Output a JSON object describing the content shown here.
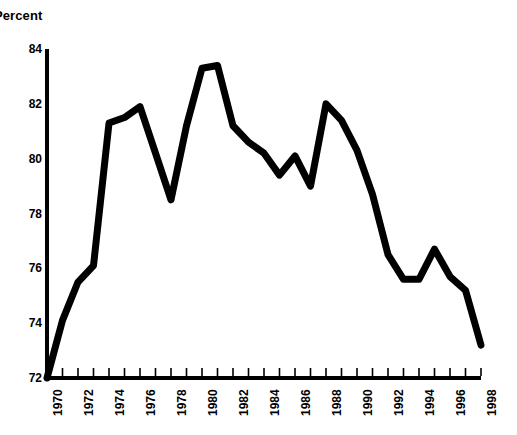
{
  "chart_data": {
    "type": "line",
    "title": "",
    "ylabel": "Percent",
    "xlabel": "",
    "ylim": [
      72,
      84
    ],
    "yticks": [
      72,
      74,
      76,
      78,
      80,
      82,
      84
    ],
    "ytick_labels": [
      "72",
      "74",
      "76",
      "78",
      "80",
      "82",
      "84"
    ],
    "xlim": [
      1970,
      1998
    ],
    "xticks": [
      1970,
      1972,
      1974,
      1976,
      1978,
      1980,
      1982,
      1984,
      1986,
      1988,
      1990,
      1992,
      1994,
      1996,
      1998
    ],
    "xtick_labels": [
      "1970",
      "1972",
      "1974",
      "1976",
      "1978",
      "1980",
      "1982",
      "1984",
      "1986",
      "1988",
      "1990",
      "1992",
      "1994",
      "1996",
      "1998"
    ],
    "minor_xticks_every": 1,
    "grid": false,
    "legend": null,
    "line_color": "#000000",
    "line_width": 7,
    "x": [
      1970,
      1971,
      1972,
      1973,
      1974,
      1975,
      1976,
      1977,
      1978,
      1979,
      1980,
      1981,
      1982,
      1983,
      1984,
      1985,
      1986,
      1987,
      1988,
      1989,
      1990,
      1991,
      1992,
      1993,
      1994,
      1995,
      1996,
      1997,
      1998
    ],
    "values": [
      72.0,
      74.1,
      75.5,
      76.1,
      81.3,
      81.5,
      81.9,
      80.2,
      78.5,
      81.2,
      83.3,
      83.4,
      81.2,
      80.6,
      80.2,
      79.4,
      80.1,
      79.0,
      82.0,
      81.4,
      80.3,
      78.7,
      76.5,
      75.6,
      75.6,
      76.7,
      75.7,
      75.2,
      73.2
    ]
  }
}
